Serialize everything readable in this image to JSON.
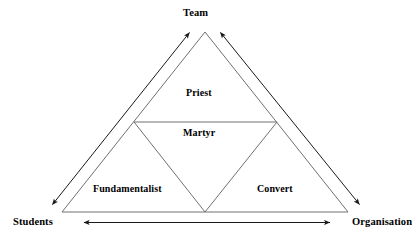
{
  "diagram": {
    "type": "subdivided-triangle-model",
    "background_color": "#ffffff",
    "line_color": "#666666",
    "arrow_color": "#1a1a1a",
    "text_color": "#000000",
    "axes": {
      "top": {
        "label": "Team",
        "arrow": "double-headed-diagonal"
      },
      "bottom_left": {
        "label": "Students",
        "arrow": "double-headed-diagonal"
      },
      "bottom_right": {
        "label": "Organisation",
        "arrow": "double-headed-diagonal"
      }
    },
    "regions": [
      {
        "id": "priest",
        "label": "Priest",
        "position": "top-center"
      },
      {
        "id": "martyr",
        "label": "Martyr",
        "position": "center-inverted"
      },
      {
        "id": "fundamentalist",
        "label": "Fundamentalist",
        "position": "bottom-left"
      },
      {
        "id": "convert",
        "label": "Convert",
        "position": "bottom-right"
      }
    ],
    "geometry": {
      "apex": [
        205,
        32
      ],
      "bottom_left": [
        62,
        212
      ],
      "bottom_right": [
        348,
        212
      ],
      "mid_left": [
        134,
        122
      ],
      "mid_right": [
        277,
        122
      ],
      "mid_base": [
        205,
        212
      ]
    }
  }
}
